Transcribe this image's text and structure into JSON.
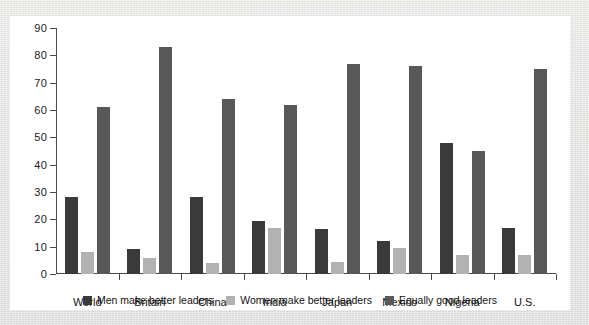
{
  "chart_data": {
    "type": "bar",
    "title": "",
    "subtitle": "",
    "xlabel": "",
    "ylabel": "",
    "ylim": [
      0,
      90
    ],
    "yticks": [
      0,
      10,
      20,
      30,
      40,
      50,
      60,
      70,
      80,
      90
    ],
    "grid": false,
    "legend_position": "bottom-center",
    "categories": [
      "World",
      "Britain",
      "China",
      "India",
      "Japan",
      "Mexico",
      "Nigeria",
      "U.S."
    ],
    "series": [
      {
        "name": "Men make better leaders",
        "color": "#3a3a3a",
        "values": [
          28,
          9,
          28,
          19.5,
          16.5,
          12,
          48,
          17
        ]
      },
      {
        "name": "Women make better leaders",
        "color": "#b2b2b2",
        "values": [
          8,
          6,
          4,
          17,
          4.5,
          9.5,
          7,
          7
        ]
      },
      {
        "name": "Equally good leaders",
        "color": "#585858",
        "values": [
          61,
          83,
          64,
          62,
          77,
          76,
          45,
          75
        ]
      }
    ]
  },
  "axis": {
    "tick_labels": [
      "90",
      "80",
      "70",
      "60",
      "50",
      "40",
      "30",
      "20",
      "10",
      "0"
    ]
  },
  "legend": {
    "items": [
      {
        "label": "Men make better leaders",
        "color": "#3a3a3a"
      },
      {
        "label": "Women make better leaders",
        "color": "#b2b2b2"
      },
      {
        "label": "Equally good leaders",
        "color": "#585858"
      }
    ]
  },
  "colors": {
    "men": "#3a3a3a",
    "women": "#b2b2b2",
    "equal": "#585858",
    "axis": "#4a4a4a",
    "card": "#ffffff",
    "page_background": "#e4e4e2"
  }
}
